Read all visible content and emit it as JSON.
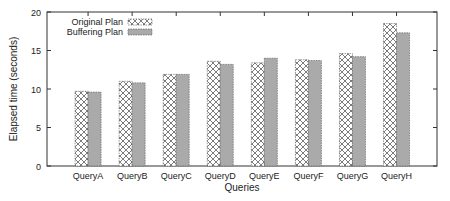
{
  "chart_data": {
    "type": "bar",
    "title": "",
    "xlabel": "Queries",
    "ylabel": "Elapsed time (seconds)",
    "ylim": [
      0,
      20
    ],
    "yticks": [
      0,
      5,
      10,
      15,
      20
    ],
    "grid": false,
    "legend_position": "top-left inside",
    "categories": [
      "QueryA",
      "QueryB",
      "QueryC",
      "QueryD",
      "QueryE",
      "QueryF",
      "QueryG",
      "QueryH"
    ],
    "series": [
      {
        "name": "Original Plan",
        "pattern": "crosshatch",
        "values": [
          9.7,
          11.0,
          11.9,
          13.6,
          13.4,
          13.8,
          14.6,
          18.5
        ]
      },
      {
        "name": "Buffering Plan",
        "pattern": "gray-fill",
        "values": [
          9.6,
          10.8,
          11.9,
          13.2,
          14.0,
          13.7,
          14.2,
          17.3
        ]
      }
    ]
  },
  "colors": {
    "axis": "#333333",
    "gray_fill": "#aaaaaa",
    "hatch": "#444444"
  }
}
